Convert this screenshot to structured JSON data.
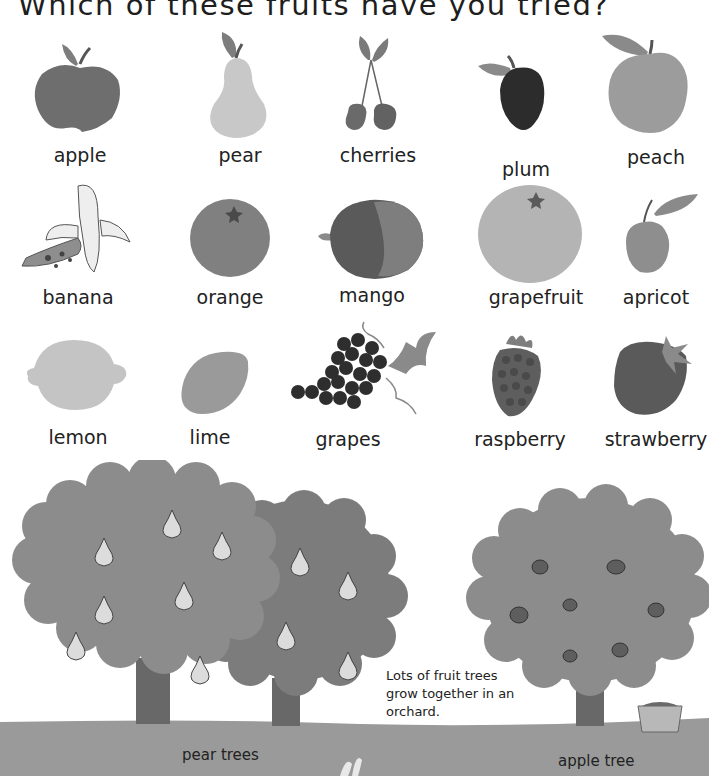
{
  "title": "Which of these fruits have you tried?",
  "fruits": [
    {
      "name": "apple",
      "label": "apple"
    },
    {
      "name": "pear",
      "label": "pear"
    },
    {
      "name": "cherries",
      "label": "cherries"
    },
    {
      "name": "plum",
      "label": "plum"
    },
    {
      "name": "peach",
      "label": "peach"
    },
    {
      "name": "banana",
      "label": "banana"
    },
    {
      "name": "orange",
      "label": "orange"
    },
    {
      "name": "mango",
      "label": "mango"
    },
    {
      "name": "grapefruit",
      "label": "grapefruit"
    },
    {
      "name": "apricot",
      "label": "apricot"
    },
    {
      "name": "lemon",
      "label": "lemon"
    },
    {
      "name": "lime",
      "label": "lime"
    },
    {
      "name": "grapes",
      "label": "grapes"
    },
    {
      "name": "raspberry",
      "label": "raspberry"
    },
    {
      "name": "strawberry",
      "label": "strawberry"
    }
  ],
  "scene": {
    "caption": "Lots of fruit trees grow together in an orchard.",
    "pear_trees_label": "pear trees",
    "apple_tree_label": "apple tree"
  },
  "colors": {
    "background": "#ffffff",
    "text": "#222222",
    "ground": "#9a9a9a",
    "foliage_light": "#8c8c8c",
    "foliage_dark": "#7a7a7a",
    "trunk": "#6a6a6a"
  }
}
